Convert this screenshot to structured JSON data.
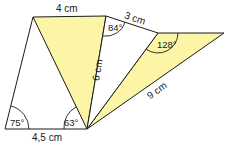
{
  "figure": {
    "fill_color": "#fdf5a6",
    "stroke_color": "#1a1a1a",
    "side_labels": {
      "top_left": "4 cm",
      "top_right": "3 cm",
      "diagonal_middle": "6 cm",
      "diagonal_right": "9 cm",
      "bottom": "4,5 cm"
    },
    "angle_labels": {
      "bottom_left": "75°",
      "bottom_apex": "63°",
      "top_middle": "84°",
      "right_vertex": "128°"
    }
  }
}
